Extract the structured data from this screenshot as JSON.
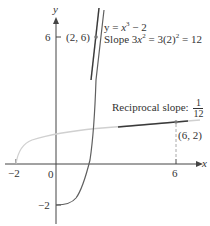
{
  "diagram": {
    "type": "function-inverse-graph",
    "axes": {
      "x_label": "x",
      "y_label": "y",
      "x_ticks": [
        "-2",
        "6"
      ],
      "y_ticks": [
        "6",
        "-2"
      ],
      "origin_label": "0"
    },
    "curves": [
      {
        "name": "f",
        "equation": "y = x^3 - 2",
        "color": "#555555"
      },
      {
        "name": "f-inverse",
        "description": "reflection of f about y = x",
        "color": "#c8c8c8"
      }
    ],
    "points": [
      {
        "label": "(2, 6)",
        "x": 2,
        "y": 6
      },
      {
        "label": "(6, 2)",
        "x": 6,
        "y": 2
      }
    ],
    "annotations": {
      "equation_prefix": "y = ",
      "equation_var": "x",
      "equation_exp": "3",
      "equation_suffix": " − 2",
      "slope_prefix": "Slope 3",
      "slope_var": "x",
      "slope_exp": "2",
      "slope_mid": " = 3(2)",
      "slope_exp2": "2",
      "slope_result": " = 12",
      "reciprocal_label": "Reciprocal slope: ",
      "reciprocal_num": "1",
      "reciprocal_den": "12"
    },
    "colors": {
      "axis": "#444444",
      "curve": "#555555",
      "inverse_curve": "#cfcfcf",
      "tangent": "#3a3a3a",
      "dashed": "#aaaaaa"
    }
  }
}
